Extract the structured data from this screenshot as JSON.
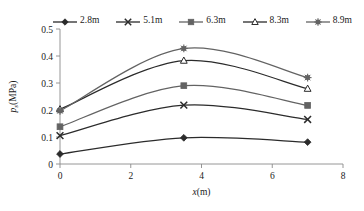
{
  "chart_data": {
    "type": "line",
    "title": "",
    "subtitle": "",
    "xlabel": "x(m)",
    "ylabel": "p_s(MPa)",
    "ylabel_base": "p",
    "ylabel_sub": "s",
    "ylabel_rest": "(MPa)",
    "x": [
      0,
      3.5,
      7.0
    ],
    "xlim": [
      0,
      8
    ],
    "ylim": [
      0,
      0.5
    ],
    "xticks": [
      0,
      2,
      4,
      6,
      8
    ],
    "xtick_labels": [
      "0",
      "2",
      "4",
      "6",
      "8"
    ],
    "yticks": [
      0,
      0.1,
      0.2,
      0.3,
      0.4,
      0.5
    ],
    "ytick_labels": [
      "0",
      "0.1",
      "0.2",
      "0.3",
      "0.4",
      "0.5"
    ],
    "grid": false,
    "legend_position": "top",
    "smoothing": "spline",
    "series": [
      {
        "name": "2.8m",
        "marker": "diamond",
        "color": "#2b2b2b",
        "values": [
          0.037,
          0.097,
          0.081
        ]
      },
      {
        "name": "5.1m",
        "marker": "cross-x",
        "color": "#2b2b2b",
        "values": [
          0.105,
          0.218,
          0.165
        ]
      },
      {
        "name": "6.3m",
        "marker": "square",
        "color": "#636363",
        "values": [
          0.138,
          0.29,
          0.217
        ]
      },
      {
        "name": "8.3m",
        "marker": "triangle-open",
        "color": "#2b2b2b",
        "values": [
          0.203,
          0.383,
          0.279
        ]
      },
      {
        "name": "8.9m",
        "marker": "star",
        "color": "#636363",
        "values": [
          0.197,
          0.428,
          0.32
        ]
      }
    ]
  },
  "legend": {
    "items": [
      {
        "label": "2.8m"
      },
      {
        "label": "5.1m"
      },
      {
        "label": "6.3m"
      },
      {
        "label": "8.3m"
      },
      {
        "label": "8.9m"
      }
    ]
  },
  "axes": {
    "x_title": "x(m)",
    "y_title_base": "p",
    "y_title_sub": "s",
    "y_title_rest": "(MPa)"
  }
}
